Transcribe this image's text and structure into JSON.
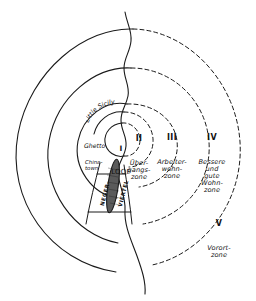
{
  "figure": {
    "ink_color": "#1a1a1a",
    "background": "#ffffff",
    "belt_fill": "#4a4a4a"
  },
  "zones": [
    {
      "numeral": "I",
      "name": "LOOP",
      "id": "zone-1-loop"
    },
    {
      "numeral": "II",
      "name": "Über-\ngangs-\nzone",
      "id": "zone-2-uebergangszone"
    },
    {
      "numeral": "III",
      "name": "Arbeiter-\nwohn-\nzone",
      "id": "zone-3-arbeiterwohnzone"
    },
    {
      "numeral": "IV",
      "name": "Bessere\nund\ngute\nWohn-\nzone",
      "id": "zone-4-bessere-und-gute-wohnzone"
    },
    {
      "numeral": "V",
      "name": "Vorort-\nzone",
      "id": "zone-5-vorortzone"
    }
  ],
  "districts": {
    "little_sicily": "Little Sicily",
    "ghetto": "Ghetto",
    "chinatown": "China-\ntown",
    "black_belt_left": "NEGER-",
    "black_belt_right": "VIERTEL"
  }
}
